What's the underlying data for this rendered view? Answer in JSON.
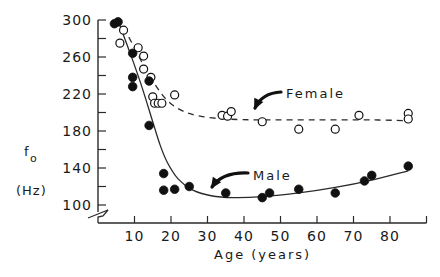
{
  "chart_data": {
    "type": "scatter",
    "title": "",
    "xlabel": "Age (years)",
    "ylabel_line1": "f",
    "ylabel_sub": "o",
    "ylabel_line2": "(Hz)",
    "xlim": [
      0,
      90
    ],
    "ylim": [
      100,
      300
    ],
    "x_ticks": [
      10,
      20,
      30,
      40,
      50,
      60,
      70,
      80
    ],
    "x_tick_labels": [
      "10",
      "20",
      "30",
      "40",
      "50",
      "60",
      "70",
      "80"
    ],
    "y_ticks_major": [
      100,
      140,
      180,
      220,
      260,
      300
    ],
    "y_tick_labels": [
      "100",
      "140",
      "180",
      "220",
      "260",
      "300"
    ],
    "y_ticks_minor": [
      120,
      160,
      200,
      240,
      280
    ],
    "y_axis_break": true,
    "grid": false,
    "legend": "inline labels with arrows",
    "series": [
      {
        "name": "Female",
        "marker": "open-circle",
        "fit_line": "dashed",
        "points": [
          {
            "x": 6,
            "y": 275
          },
          {
            "x": 7,
            "y": 289
          },
          {
            "x": 11,
            "y": 270
          },
          {
            "x": 12.5,
            "y": 261
          },
          {
            "x": 12.5,
            "y": 247
          },
          {
            "x": 14.5,
            "y": 238
          },
          {
            "x": 15,
            "y": 217
          },
          {
            "x": 15.5,
            "y": 210
          },
          {
            "x": 16.5,
            "y": 210
          },
          {
            "x": 17.5,
            "y": 210
          },
          {
            "x": 21,
            "y": 219
          },
          {
            "x": 34,
            "y": 197
          },
          {
            "x": 35.5,
            "y": 196
          },
          {
            "x": 36.5,
            "y": 201
          },
          {
            "x": 45,
            "y": 190
          },
          {
            "x": 55,
            "y": 182
          },
          {
            "x": 65,
            "y": 182
          },
          {
            "x": 71.5,
            "y": 197
          },
          {
            "x": 85,
            "y": 199
          },
          {
            "x": 85,
            "y": 193
          }
        ],
        "fit": [
          {
            "x": 7,
            "y": 292
          },
          {
            "x": 10,
            "y": 270
          },
          {
            "x": 13,
            "y": 247
          },
          {
            "x": 16,
            "y": 228
          },
          {
            "x": 19,
            "y": 213
          },
          {
            "x": 23,
            "y": 202
          },
          {
            "x": 28,
            "y": 196
          },
          {
            "x": 35,
            "y": 193
          },
          {
            "x": 45,
            "y": 192
          },
          {
            "x": 60,
            "y": 192
          },
          {
            "x": 75,
            "y": 192
          },
          {
            "x": 86,
            "y": 191
          }
        ]
      },
      {
        "name": "Male",
        "marker": "filled-circle",
        "fit_line": "solid",
        "points": [
          {
            "x": 4.5,
            "y": 296
          },
          {
            "x": 5.5,
            "y": 298
          },
          {
            "x": 9.5,
            "y": 264
          },
          {
            "x": 9.5,
            "y": 238
          },
          {
            "x": 9.5,
            "y": 228
          },
          {
            "x": 14,
            "y": 234
          },
          {
            "x": 14,
            "y": 186
          },
          {
            "x": 18,
            "y": 134
          },
          {
            "x": 18,
            "y": 116
          },
          {
            "x": 21,
            "y": 117
          },
          {
            "x": 25,
            "y": 120
          },
          {
            "x": 35,
            "y": 113
          },
          {
            "x": 45,
            "y": 108
          },
          {
            "x": 47,
            "y": 113
          },
          {
            "x": 55,
            "y": 117
          },
          {
            "x": 65,
            "y": 113
          },
          {
            "x": 73,
            "y": 126
          },
          {
            "x": 75,
            "y": 132
          },
          {
            "x": 85,
            "y": 142
          }
        ],
        "fit": [
          {
            "x": 6,
            "y": 294
          },
          {
            "x": 9,
            "y": 262
          },
          {
            "x": 12,
            "y": 228
          },
          {
            "x": 15,
            "y": 190
          },
          {
            "x": 17,
            "y": 165
          },
          {
            "x": 19,
            "y": 146
          },
          {
            "x": 22,
            "y": 128
          },
          {
            "x": 26,
            "y": 116
          },
          {
            "x": 31,
            "y": 110
          },
          {
            "x": 37,
            "y": 108
          },
          {
            "x": 45,
            "y": 109
          },
          {
            "x": 55,
            "y": 113
          },
          {
            "x": 65,
            "y": 119
          },
          {
            "x": 75,
            "y": 127
          },
          {
            "x": 85,
            "y": 137
          }
        ]
      }
    ],
    "annotations": [
      {
        "text": "Female",
        "text_pos": {
          "x": 265,
          "y": 94
        },
        "arrow_to": {
          "x": 42,
          "y": 200
        }
      },
      {
        "text": "Male",
        "text_pos": {
          "x": 240,
          "y": 178
        },
        "arrow_to": {
          "x": 30,
          "y": 110
        }
      }
    ]
  },
  "axes": {
    "x_title": "Age (years)",
    "y_title_main": "f",
    "y_title_sub": "o",
    "y_title_units": "(Hz)"
  },
  "labels": {
    "female": "Female",
    "male": "Male"
  }
}
